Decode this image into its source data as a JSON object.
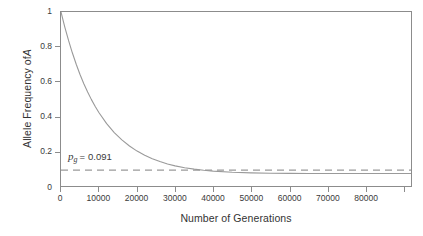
{
  "chart_data": {
    "type": "line",
    "title": "",
    "subtitle": "",
    "xlabel": "Number of Generations",
    "ylabel_parts": {
      "prefix": "Allele Frequency of ",
      "italic": "A"
    },
    "ylabel": "Allele Frequency of A",
    "xlim": [
      0,
      92000
    ],
    "ylim": [
      0,
      1
    ],
    "grid": false,
    "legend": null,
    "x_ticks": [
      0,
      10000,
      20000,
      30000,
      40000,
      50000,
      60000,
      70000,
      80000,
      90000
    ],
    "x_tick_labels": [
      "0",
      "10000",
      "20000",
      "30000",
      "40000",
      "50000",
      "60000",
      "70000",
      "80000",
      ""
    ],
    "y_ticks": [
      0,
      0.2,
      0.4,
      0.6,
      0.8,
      1
    ],
    "y_tick_labels": [
      "0",
      "0.2",
      "0.4",
      "0.6",
      "0.8",
      "1"
    ],
    "series": [
      {
        "name": "allele-frequency-decay",
        "style": "solid",
        "color": "#9a9a9a",
        "asymptote": 0.091,
        "start_value": 1,
        "x": [
          0,
          1000,
          2000,
          3000,
          4000,
          5000,
          6000,
          7000,
          8000,
          9000,
          10000,
          12000,
          14000,
          16000,
          18000,
          20000,
          22000,
          24000,
          26000,
          28000,
          30000,
          32500,
          35000,
          37500,
          40000,
          45000,
          50000,
          55000,
          60000,
          65000,
          70000,
          75000,
          80000,
          85000,
          92000
        ],
        "values": [
          1.0,
          0.9136,
          0.8352,
          0.7641,
          0.6996,
          0.6411,
          0.5881,
          0.54,
          0.4964,
          0.4568,
          0.421,
          0.3587,
          0.3073,
          0.2648,
          0.2297,
          0.2006,
          0.1766,
          0.1567,
          0.1403,
          0.1267,
          0.1155,
          0.1051,
          0.0969,
          0.0906,
          0.0857,
          0.0791,
          0.0755,
          0.0736,
          0.0726,
          0.0721,
          0.0719,
          0.0718,
          0.0717,
          0.0717,
          0.0717
        ]
      },
      {
        "name": "equilibrium-asymptote",
        "style": "dashed",
        "color": "#9a9a9a",
        "constant_value": 0.091
      }
    ],
    "annotations": [
      {
        "name": "equilibrium-frequency-label",
        "variable": "p",
        "subscript": "g",
        "operator": "=",
        "value": "0.091",
        "x": 4000,
        "y": 0.155
      }
    ]
  },
  "axes": {
    "frame_color": "#8c8c8c",
    "tick_color": "#8c8c8c",
    "text_color": "#3a3a3a"
  }
}
